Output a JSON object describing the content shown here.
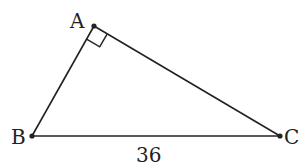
{
  "diagram": {
    "type": "right-triangle",
    "vertices": {
      "A": {
        "label": "A",
        "x": 94,
        "y": 26
      },
      "B": {
        "label": "B",
        "x": 32,
        "y": 136
      },
      "C": {
        "label": "C",
        "x": 280,
        "y": 136
      }
    },
    "right_angle_at": "A",
    "sides": [
      {
        "from": "B",
        "to": "C",
        "label": "36"
      }
    ],
    "colors": {
      "stroke": "#222222",
      "background": "#ffffff"
    }
  }
}
